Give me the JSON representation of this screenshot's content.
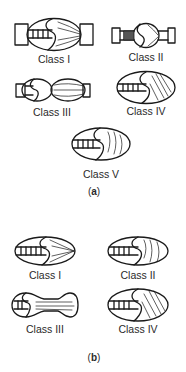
{
  "figure": {
    "panel_a": {
      "caption_open": "(",
      "caption_letter": "a",
      "caption_close": ")",
      "items": [
        {
          "label": "Class I",
          "shape": "ellipse-with-end-tubes"
        },
        {
          "label": "Class II",
          "shape": "small-bulb-with-long-tubes"
        },
        {
          "label": "Class III",
          "shape": "double-bulb"
        },
        {
          "label": "Class IV",
          "shape": "ellipse-hatched"
        },
        {
          "label": "Class V",
          "shape": "ellipse-curved-lines"
        }
      ]
    },
    "panel_b": {
      "caption_open": "(",
      "caption_letter": "b",
      "caption_close": ")",
      "items": [
        {
          "label": "Class I",
          "shape": "ellipse-fan-lines"
        },
        {
          "label": "Class II",
          "shape": "ellipse-curved-lines"
        },
        {
          "label": "Class III",
          "shape": "dumbbell"
        },
        {
          "label": "Class IV",
          "shape": "ellipse-hatched"
        }
      ]
    }
  },
  "colors": {
    "stroke": "#1a1a1a",
    "background": "#ffffff"
  }
}
